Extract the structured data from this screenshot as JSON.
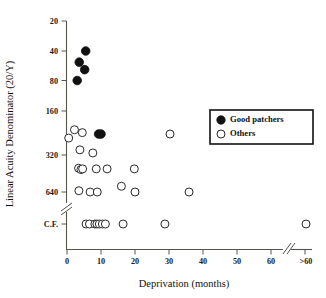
{
  "chart_data": {
    "type": "scatter",
    "title": "",
    "xlabel": "Deprivation (months)",
    "ylabel": "Linear Acuity  Denominator (20/Y)",
    "grid": false,
    "legend_position": "upper-right",
    "x_axis": {
      "ticks": [
        0,
        10,
        20,
        30,
        40,
        50,
        60
      ],
      "tick_labels": [
        "0",
        "10",
        "20",
        "30",
        "40",
        "50",
        "60"
      ],
      "overflow_label": ">60",
      "has_break": true,
      "break_between": [
        60,
        ">60"
      ],
      "range": [
        0,
        60
      ]
    },
    "y_axis": {
      "tick_labels": [
        "20",
        "40",
        "80",
        "160",
        "320",
        "640",
        "C.F."
      ],
      "tick_values": [
        20,
        40,
        80,
        160,
        320,
        640,
        "C.F."
      ],
      "scale": "log-like descending",
      "has_break": true,
      "break_between": [
        "640",
        "C.F."
      ]
    },
    "series": [
      {
        "name": "Good patchers",
        "marker": "filled-circle",
        "color": "#111111",
        "points": [
          {
            "x": 5.5,
            "y": "40"
          },
          {
            "x": 3.6,
            "y": "52"
          },
          {
            "x": 5.2,
            "y": "62"
          },
          {
            "x": 3.0,
            "y": "80"
          },
          {
            "x": 9.3,
            "y": "230"
          },
          {
            "x": 10.0,
            "y": "230"
          }
        ]
      },
      {
        "name": "Others",
        "marker": "open-circle",
        "color": "#ffffff",
        "points": [
          {
            "x": 0.5,
            "y": "245"
          },
          {
            "x": 2.2,
            "y": "215"
          },
          {
            "x": 4.5,
            "y": "225"
          },
          {
            "x": 30.3,
            "y": "230"
          },
          {
            "x": 3.8,
            "y": "295"
          },
          {
            "x": 7.6,
            "y": "310"
          },
          {
            "x": 3.4,
            "y": "410"
          },
          {
            "x": 4.1,
            "y": "420"
          },
          {
            "x": 4.6,
            "y": "415"
          },
          {
            "x": 8.6,
            "y": "415"
          },
          {
            "x": 11.8,
            "y": "415"
          },
          {
            "x": 19.8,
            "y": "415"
          },
          {
            "x": 16.0,
            "y": "575"
          },
          {
            "x": 3.5,
            "y": "625"
          },
          {
            "x": 35.9,
            "y": "690"
          },
          {
            "x": 6.8,
            "y": "760"
          },
          {
            "x": 8.9,
            "y": "760"
          },
          {
            "x": 20.0,
            "y": "745"
          },
          {
            "x": 5.6,
            "y": "C.F."
          },
          {
            "x": 6.6,
            "y": "C.F."
          },
          {
            "x": 8.2,
            "y": "C.F."
          },
          {
            "x": 8.8,
            "y": "C.F."
          },
          {
            "x": 9.5,
            "y": "C.F."
          },
          {
            "x": 10.4,
            "y": "C.F."
          },
          {
            "x": 11.3,
            "y": "C.F."
          },
          {
            "x": 16.5,
            "y": "C.F."
          },
          {
            "x": 28.8,
            "y": "C.F."
          },
          {
            "x": 60.5,
            "y": "C.F."
          }
        ]
      }
    ]
  },
  "legend": {
    "entries": [
      {
        "label": "Good patchers",
        "marker": "filled-circle"
      },
      {
        "label": "Others",
        "marker": "open-circle"
      }
    ]
  }
}
